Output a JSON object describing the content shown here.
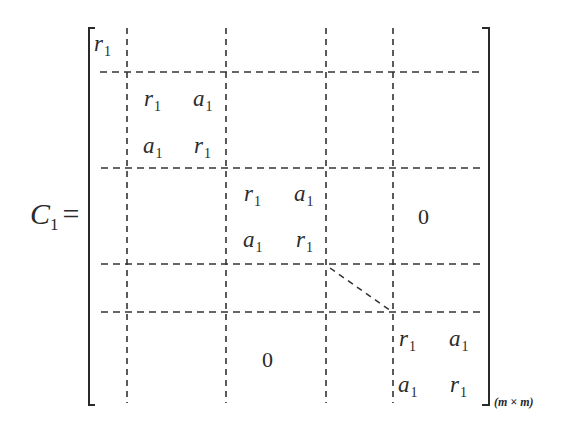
{
  "equation": {
    "lhs_symbol": "C",
    "lhs_subscript": "1",
    "equals": "=",
    "dimension_label": "(m × m)"
  },
  "matrix": {
    "top_left_cell": {
      "symbol": "r",
      "subscript": "1"
    },
    "blocks": [
      {
        "name": "block-1",
        "cells": [
          [
            {
              "symbol": "r",
              "subscript": "1"
            },
            {
              "symbol": "a",
              "subscript": "1"
            }
          ],
          [
            {
              "symbol": "a",
              "subscript": "1"
            },
            {
              "symbol": "r",
              "subscript": "1"
            }
          ]
        ]
      },
      {
        "name": "block-2",
        "cells": [
          [
            {
              "symbol": "r",
              "subscript": "1"
            },
            {
              "symbol": "a",
              "subscript": "1"
            }
          ],
          [
            {
              "symbol": "a",
              "subscript": "1"
            },
            {
              "symbol": "r",
              "subscript": "1"
            }
          ]
        ]
      },
      {
        "name": "block-last",
        "cells": [
          [
            {
              "symbol": "r",
              "subscript": "1"
            },
            {
              "symbol": "a",
              "subscript": "1"
            }
          ],
          [
            {
              "symbol": "a",
              "subscript": "1"
            },
            {
              "symbol": "r",
              "subscript": "1"
            }
          ]
        ]
      }
    ],
    "upper_zero": "0",
    "lower_zero": "0",
    "ellipsis": "diagonal dashed line (continuation)"
  },
  "colors": {
    "ink": "#2a2a2a",
    "background": "#ffffff"
  }
}
